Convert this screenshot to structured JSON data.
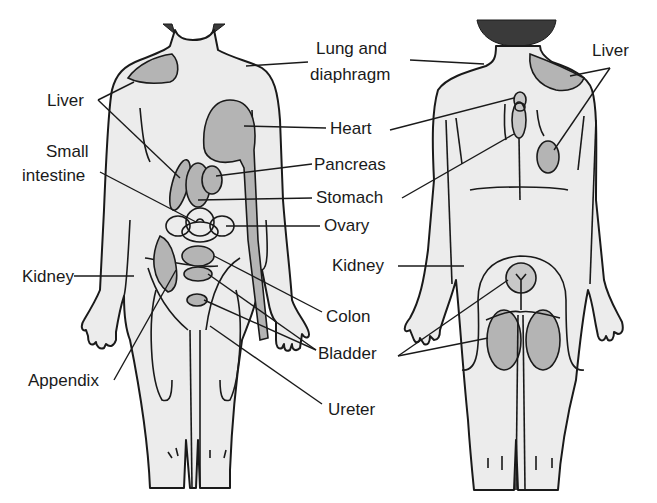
{
  "figure": {
    "front_view": {
      "labels": [
        {
          "id": "liver",
          "text": "Liver",
          "x": 47,
          "y": 92
        },
        {
          "id": "small-intestine-1",
          "text": "Small",
          "x": 46,
          "y": 142
        },
        {
          "id": "small-intestine-2",
          "text": "intestine",
          "x": 22,
          "y": 168
        },
        {
          "id": "kidney",
          "text": "Kidney",
          "x": 22,
          "y": 268
        },
        {
          "id": "appendix",
          "text": "Appendix",
          "x": 28,
          "y": 368
        }
      ]
    },
    "center_labels": [
      {
        "id": "lung-diaphragm-1",
        "text": "Lung and",
        "x": 318,
        "y": 40
      },
      {
        "id": "lung-diaphragm-2",
        "text": "diaphragm",
        "x": 310,
        "y": 66
      },
      {
        "id": "heart",
        "text": "Heart",
        "x": 330,
        "y": 118
      },
      {
        "id": "pancreas",
        "text": "Pancreas",
        "x": 314,
        "y": 154
      },
      {
        "id": "stomach",
        "text": "Stomach",
        "x": 316,
        "y": 186
      },
      {
        "id": "ovary",
        "text": "Ovary",
        "x": 324,
        "y": 214
      },
      {
        "id": "kidney-back",
        "text": "Kidney",
        "x": 332,
        "y": 255
      },
      {
        "id": "colon",
        "text": "Colon",
        "x": 326,
        "y": 306
      },
      {
        "id": "bladder",
        "text": "Bladder",
        "x": 318,
        "y": 344
      },
      {
        "id": "ureter",
        "text": "Ureter",
        "x": 328,
        "y": 400
      }
    ],
    "back_view": {
      "labels": [
        {
          "id": "liver-back",
          "text": "Liver",
          "x": 592,
          "y": 42
        }
      ]
    }
  }
}
